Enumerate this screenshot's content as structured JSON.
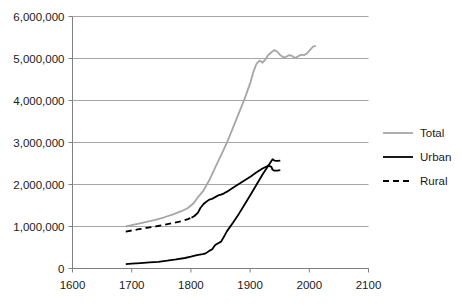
{
  "chart_data": {
    "type": "line",
    "title": "",
    "xlabel": "",
    "ylabel": "",
    "xlim": [
      1600,
      2100
    ],
    "ylim": [
      0,
      6000000
    ],
    "xticks": [
      "1600",
      "1700",
      "1800",
      "1900",
      "2000",
      "2100"
    ],
    "xtick_values": [
      1600,
      1700,
      1800,
      1900,
      2000,
      2100
    ],
    "yticks": [
      "0",
      "1,000,000",
      "2,000,000",
      "3,000,000",
      "4,000,000",
      "5,000,000",
      "6,000,000"
    ],
    "ytick_values": [
      0,
      1000000,
      2000000,
      3000000,
      4000000,
      5000000,
      6000000
    ],
    "grid": true,
    "legend_position": "right",
    "colors": {
      "total": "#a6a6a6",
      "urban": "#000000",
      "rural": "#000000",
      "grid": "#a6a6a6",
      "axis": "#808080",
      "text": "#1a1a1a"
    },
    "series": [
      {
        "name": "Total",
        "style": "solid",
        "color": "#a6a6a6",
        "width": 1.8,
        "points": [
          [
            1690,
            1000000
          ],
          [
            1700,
            1030000
          ],
          [
            1712,
            1070000
          ],
          [
            1725,
            1110000
          ],
          [
            1740,
            1160000
          ],
          [
            1755,
            1220000
          ],
          [
            1770,
            1290000
          ],
          [
            1785,
            1370000
          ],
          [
            1795,
            1440000
          ],
          [
            1800,
            1500000
          ],
          [
            1805,
            1560000
          ],
          [
            1812,
            1700000
          ],
          [
            1821,
            1850000
          ],
          [
            1831,
            2100000
          ],
          [
            1841,
            2400000
          ],
          [
            1851,
            2700000
          ],
          [
            1861,
            3000000
          ],
          [
            1871,
            3350000
          ],
          [
            1881,
            3700000
          ],
          [
            1891,
            4050000
          ],
          [
            1901,
            4450000
          ],
          [
            1906,
            4700000
          ],
          [
            1911,
            4880000
          ],
          [
            1916,
            4950000
          ],
          [
            1921,
            4900000
          ],
          [
            1926,
            4980000
          ],
          [
            1931,
            5090000
          ],
          [
            1936,
            5150000
          ],
          [
            1941,
            5200000
          ],
          [
            1946,
            5160000
          ],
          [
            1951,
            5080000
          ],
          [
            1956,
            5030000
          ],
          [
            1961,
            5040000
          ],
          [
            1966,
            5080000
          ],
          [
            1971,
            5060000
          ],
          [
            1976,
            5010000
          ],
          [
            1981,
            5050000
          ],
          [
            1986,
            5090000
          ],
          [
            1991,
            5080000
          ],
          [
            1996,
            5120000
          ],
          [
            2001,
            5200000
          ],
          [
            2006,
            5280000
          ],
          [
            2011,
            5300000
          ]
        ]
      },
      {
        "name": "Urban",
        "style": "solid",
        "color": "#000000",
        "width": 1.8,
        "points": [
          [
            1690,
            105000
          ],
          [
            1700,
            115000
          ],
          [
            1715,
            130000
          ],
          [
            1730,
            145000
          ],
          [
            1745,
            160000
          ],
          [
            1760,
            185000
          ],
          [
            1775,
            215000
          ],
          [
            1790,
            250000
          ],
          [
            1800,
            280000
          ],
          [
            1805,
            300000
          ],
          [
            1810,
            320000
          ],
          [
            1815,
            330000
          ],
          [
            1820,
            340000
          ],
          [
            1825,
            360000
          ],
          [
            1831,
            420000
          ],
          [
            1836,
            460000
          ],
          [
            1841,
            560000
          ],
          [
            1846,
            600000
          ],
          [
            1851,
            640000
          ],
          [
            1856,
            760000
          ],
          [
            1861,
            890000
          ],
          [
            1871,
            1090000
          ],
          [
            1881,
            1300000
          ],
          [
            1891,
            1530000
          ],
          [
            1901,
            1760000
          ],
          [
            1911,
            2000000
          ],
          [
            1921,
            2240000
          ],
          [
            1931,
            2450000
          ],
          [
            1936,
            2560000
          ],
          [
            1938,
            2600000
          ],
          [
            1941,
            2570000
          ],
          [
            1946,
            2560000
          ],
          [
            1951,
            2570000
          ]
        ]
      },
      {
        "name": "Rural",
        "style": "dashed-then-solid",
        "color": "#000000",
        "width": 1.8,
        "dash_until": 1801,
        "points": [
          [
            1690,
            880000
          ],
          [
            1700,
            905000
          ],
          [
            1712,
            935000
          ],
          [
            1725,
            965000
          ],
          [
            1740,
            1000000
          ],
          [
            1755,
            1040000
          ],
          [
            1770,
            1085000
          ],
          [
            1785,
            1130000
          ],
          [
            1795,
            1175000
          ],
          [
            1801,
            1210000
          ],
          [
            1806,
            1250000
          ],
          [
            1812,
            1330000
          ],
          [
            1816,
            1440000
          ],
          [
            1821,
            1530000
          ],
          [
            1826,
            1590000
          ],
          [
            1831,
            1640000
          ],
          [
            1836,
            1660000
          ],
          [
            1841,
            1700000
          ],
          [
            1846,
            1740000
          ],
          [
            1851,
            1760000
          ],
          [
            1856,
            1790000
          ],
          [
            1861,
            1830000
          ],
          [
            1871,
            1920000
          ],
          [
            1881,
            2010000
          ],
          [
            1891,
            2100000
          ],
          [
            1901,
            2190000
          ],
          [
            1911,
            2290000
          ],
          [
            1921,
            2380000
          ],
          [
            1931,
            2450000
          ],
          [
            1936,
            2420000
          ],
          [
            1938,
            2350000
          ],
          [
            1941,
            2330000
          ],
          [
            1946,
            2330000
          ],
          [
            1951,
            2340000
          ]
        ]
      }
    ]
  },
  "legend": {
    "items": [
      {
        "label": "Total",
        "key": "total"
      },
      {
        "label": "Urban",
        "key": "urban"
      },
      {
        "label": "Rural",
        "key": "rural"
      }
    ]
  }
}
